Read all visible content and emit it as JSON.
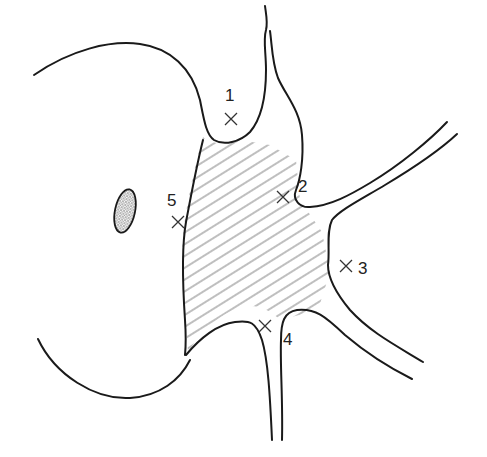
{
  "diagram": {
    "colors": {
      "line": "#1a1a1a",
      "hatch": "#8a8a8a",
      "background": "#ffffff"
    },
    "markers": [
      {
        "id": "1",
        "label": "1",
        "x": 231,
        "y": 119,
        "label_x": 225,
        "label_y": 100
      },
      {
        "id": "2",
        "label": "2",
        "x": 283,
        "y": 197,
        "label_x": 298,
        "label_y": 191
      },
      {
        "id": "3",
        "label": "3",
        "x": 346,
        "y": 266,
        "label_x": 358,
        "label_y": 273
      },
      {
        "id": "4",
        "label": "4",
        "x": 265,
        "y": 326,
        "label_x": 283,
        "label_y": 344
      },
      {
        "id": "5",
        "label": "5",
        "x": 178,
        "y": 222,
        "label_x": 167,
        "label_y": 205
      }
    ],
    "shaded_region": "hatched"
  }
}
